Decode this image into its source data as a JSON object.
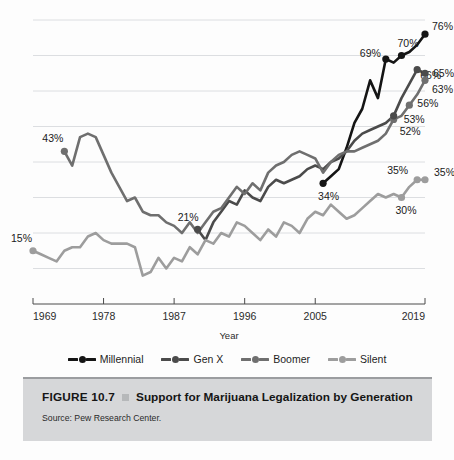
{
  "figure": {
    "number": "FIGURE 10.7",
    "bullet_icon": "square-bullet-icon",
    "title": "Support for Marijuana Legalization by Generation",
    "source": "Source: Pew Research Center."
  },
  "legend": {
    "items": [
      {
        "label": "Millennial",
        "color": "#151515"
      },
      {
        "label": "Gen X",
        "color": "#4b4b4b"
      },
      {
        "label": "Boomer",
        "color": "#6f6f6f"
      },
      {
        "label": "Silent",
        "color": "#9d9d9d"
      }
    ]
  },
  "axis": {
    "x_title": "Year",
    "x_ticks": [
      "1969",
      "1978",
      "1987",
      "1996",
      "2005",
      "2019"
    ],
    "x_tick_values": [
      1969,
      1978,
      1987,
      1996,
      2005,
      2019
    ]
  },
  "point_labels": {
    "millennial": [
      "34%",
      "69%",
      "70%",
      "76%"
    ],
    "genx": [
      "21%",
      "53%",
      "66%",
      "65%"
    ],
    "boomer": [
      "43%",
      "52%",
      "56%",
      "63%"
    ],
    "silent": [
      "15%",
      "30%",
      "35%",
      "35%"
    ]
  },
  "chart_data": {
    "type": "line",
    "title": "Support for Marijuana Legalization by Generation",
    "subtitle": "",
    "xlabel": "Year",
    "ylabel": "",
    "xlim": [
      1969,
      2019
    ],
    "ylim": [
      0,
      80
    ],
    "grid": true,
    "gridlines_y": [
      10,
      20,
      30,
      40,
      50,
      60,
      70,
      80
    ],
    "legend_position": "bottom",
    "annotations": [
      {
        "series": "Boomer",
        "x": 1973,
        "y": 43,
        "text": "43%"
      },
      {
        "series": "Silent",
        "x": 1969,
        "y": 15,
        "text": "15%"
      },
      {
        "series": "Gen X",
        "x": 1990,
        "y": 21,
        "text": "21%"
      },
      {
        "series": "Millennial",
        "x": 2006,
        "y": 34,
        "text": "34%"
      },
      {
        "series": "Boomer",
        "x": 2015,
        "y": 52,
        "text": "52%"
      },
      {
        "series": "Gen X",
        "x": 2015,
        "y": 53,
        "text": "53%"
      },
      {
        "series": "Boomer",
        "x": 2017,
        "y": 56,
        "text": "56%"
      },
      {
        "series": "Millennial",
        "x": 2014,
        "y": 69,
        "text": "69%"
      },
      {
        "series": "Millennial",
        "x": 2016,
        "y": 70,
        "text": "70%"
      },
      {
        "series": "Millennial",
        "x": 2019,
        "y": 76,
        "text": "76%"
      },
      {
        "series": "Gen X",
        "x": 2018,
        "y": 66,
        "text": "66%"
      },
      {
        "series": "Gen X",
        "x": 2019,
        "y": 65,
        "text": "65%"
      },
      {
        "series": "Boomer",
        "x": 2019,
        "y": 63,
        "text": "63%"
      },
      {
        "series": "Silent",
        "x": 2016,
        "y": 30,
        "text": "30%"
      },
      {
        "series": "Silent",
        "x": 2018,
        "y": 35,
        "text": "35%"
      },
      {
        "series": "Silent",
        "x": 2019,
        "y": 35,
        "text": "35%"
      }
    ],
    "series": [
      {
        "name": "Millennial",
        "color": "#151515",
        "x": [
          2006,
          2007,
          2008,
          2009,
          2010,
          2011,
          2012,
          2013,
          2014,
          2015,
          2016,
          2017,
          2018,
          2019
        ],
        "values": [
          34,
          36,
          38,
          44,
          51,
          55,
          63,
          58,
          69,
          68,
          70,
          71,
          73,
          76
        ]
      },
      {
        "name": "Gen X",
        "color": "#4b4b4b",
        "x": [
          1990,
          1991,
          1992,
          1993,
          1994,
          1995,
          1996,
          1997,
          1998,
          1999,
          2000,
          2001,
          2002,
          2003,
          2004,
          2005,
          2006,
          2007,
          2008,
          2009,
          2010,
          2011,
          2012,
          2013,
          2014,
          2015,
          2016,
          2017,
          2018,
          2019
        ],
        "values": [
          21,
          18,
          23,
          26,
          29,
          28,
          32,
          30,
          29,
          33,
          35,
          34,
          35,
          36,
          38,
          39,
          38,
          40,
          41,
          43,
          46,
          48,
          49,
          50,
          51,
          53,
          58,
          62,
          66,
          65
        ]
      },
      {
        "name": "Boomer",
        "color": "#6f6f6f",
        "x": [
          1973,
          1974,
          1975,
          1976,
          1977,
          1978,
          1979,
          1980,
          1981,
          1982,
          1983,
          1984,
          1985,
          1986,
          1987,
          1988,
          1989,
          1990,
          1991,
          1992,
          1993,
          1994,
          1995,
          1996,
          1997,
          1998,
          1999,
          2000,
          2001,
          2002,
          2003,
          2004,
          2005,
          2006,
          2007,
          2008,
          2009,
          2010,
          2011,
          2012,
          2013,
          2014,
          2015,
          2016,
          2017,
          2018,
          2019
        ],
        "values": [
          43,
          39,
          47,
          48,
          47,
          42,
          37,
          33,
          29,
          30,
          26,
          25,
          25,
          23,
          22,
          20,
          23,
          20,
          23,
          26,
          27,
          30,
          33,
          31,
          34,
          32,
          37,
          39,
          40,
          42,
          43,
          42,
          41,
          37,
          40,
          42,
          43,
          43,
          44,
          45,
          46,
          48,
          52,
          53,
          56,
          59,
          63
        ]
      },
      {
        "name": "Silent",
        "color": "#9d9d9d",
        "x": [
          1969,
          1970,
          1971,
          1972,
          1973,
          1974,
          1975,
          1976,
          1977,
          1978,
          1979,
          1980,
          1981,
          1982,
          1983,
          1984,
          1985,
          1986,
          1987,
          1988,
          1989,
          1990,
          1991,
          1992,
          1993,
          1994,
          1995,
          1996,
          1997,
          1998,
          1999,
          2000,
          2001,
          2002,
          2003,
          2004,
          2005,
          2006,
          2007,
          2008,
          2009,
          2010,
          2011,
          2012,
          2013,
          2014,
          2015,
          2016,
          2017,
          2018,
          2019
        ],
        "values": [
          15,
          14,
          13,
          12,
          15,
          16,
          16,
          19,
          20,
          18,
          17,
          17,
          17,
          16,
          8,
          9,
          13,
          10,
          13,
          12,
          16,
          14,
          18,
          17,
          20,
          19,
          23,
          22,
          20,
          18,
          21,
          19,
          23,
          22,
          20,
          24,
          26,
          25,
          28,
          26,
          24,
          25,
          27,
          29,
          31,
          30,
          31,
          30,
          33,
          35,
          35
        ]
      }
    ]
  }
}
